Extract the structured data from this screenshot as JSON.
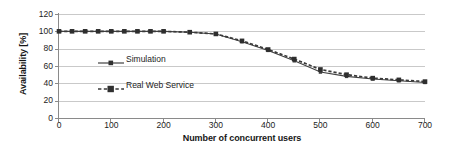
{
  "chart_data": {
    "type": "line",
    "title": "",
    "xlabel": "Number of concurrent users",
    "ylabel": "Availability [%]",
    "xlim": [
      0,
      700
    ],
    "ylim": [
      0,
      120
    ],
    "xticks": [
      0,
      100,
      200,
      300,
      400,
      500,
      600,
      700
    ],
    "yticks": [
      0,
      20,
      40,
      60,
      80,
      100,
      120
    ],
    "grid": "horizontal",
    "legend_position": "inside-left",
    "series": [
      {
        "name": "Simulation",
        "style": "solid",
        "marker": "square",
        "color": "#404040",
        "x": [
          0,
          25,
          50,
          75,
          100,
          125,
          150,
          175,
          200,
          250,
          300,
          350,
          400,
          450,
          500,
          550,
          600,
          650,
          700
        ],
        "values": [
          100,
          100,
          100,
          100,
          100,
          100,
          100,
          100,
          100,
          99,
          97,
          88,
          78,
          66,
          53,
          48,
          45,
          43,
          41
        ]
      },
      {
        "name": "Real Web Service",
        "style": "dashed",
        "marker": "square",
        "color": "#3a3a3a",
        "x": [
          0,
          25,
          50,
          75,
          100,
          125,
          150,
          175,
          200,
          250,
          300,
          350,
          400,
          450,
          500,
          550,
          600,
          650,
          700
        ],
        "values": [
          100,
          100,
          100,
          100,
          100,
          100,
          100,
          100,
          100,
          99,
          97,
          89,
          79,
          68,
          56,
          50,
          46,
          44,
          42
        ]
      }
    ]
  },
  "axis": {
    "y_title": "Availability [%]",
    "x_title": "Number of concurrent users",
    "y_tick_labels": [
      "120",
      "100",
      "80",
      "60",
      "40",
      "20",
      "0"
    ],
    "x_tick_labels": [
      "0",
      "100",
      "200",
      "300",
      "400",
      "500",
      "600",
      "700"
    ]
  },
  "legend": {
    "items": [
      {
        "label": "Simulation"
      },
      {
        "label": "Real Web Service"
      }
    ]
  }
}
